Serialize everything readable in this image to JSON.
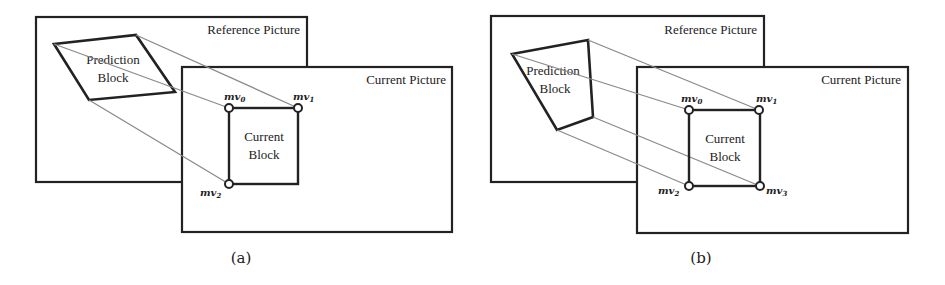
{
  "panels": [
    {
      "caption": "(a)",
      "reference_label": "Reference Picture",
      "current_label": "Current Picture",
      "prediction_label_1": "Prediction",
      "prediction_label_2": "Block",
      "current_block_label_1": "Current",
      "current_block_label_2": "Block",
      "control_points": [
        {
          "name": "mv",
          "sub": "0"
        },
        {
          "name": "mv",
          "sub": "1"
        },
        {
          "name": "mv",
          "sub": "2"
        }
      ]
    },
    {
      "caption": "(b)",
      "reference_label": "Reference Picture",
      "current_label": "Current Picture",
      "prediction_label_1": "Prediction",
      "prediction_label_2": "Block",
      "current_block_label_1": "Current",
      "current_block_label_2": "Block",
      "control_points": [
        {
          "name": "mv",
          "sub": "0"
        },
        {
          "name": "mv",
          "sub": "1"
        },
        {
          "name": "mv",
          "sub": "2"
        },
        {
          "name": "mv",
          "sub": "3"
        }
      ]
    }
  ],
  "colors": {
    "frame": "#222222",
    "projection_line": "#8a8a8a"
  }
}
